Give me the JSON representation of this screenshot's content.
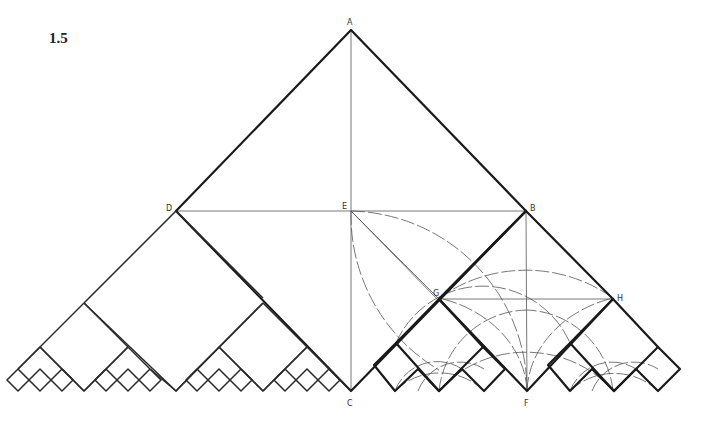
{
  "figure": {
    "number": "1.5",
    "points": {
      "A": {
        "label": "A",
        "x": 351,
        "y": 30
      },
      "D": {
        "label": "D",
        "x": 176,
        "y": 211
      },
      "E": {
        "label": "E",
        "x": 351,
        "y": 211
      },
      "B": {
        "label": "B",
        "x": 526,
        "y": 211
      },
      "G": {
        "label": "G",
        "x": 439,
        "y": 299
      },
      "H": {
        "label": "H",
        "x": 613,
        "y": 299
      },
      "C": {
        "label": "C",
        "x": 351,
        "y": 391
      },
      "F": {
        "label": "F",
        "x": 527,
        "y": 391
      }
    },
    "colors": {
      "line": "#1a1a1a",
      "construction": "#555555",
      "background": "#ffffff"
    }
  }
}
